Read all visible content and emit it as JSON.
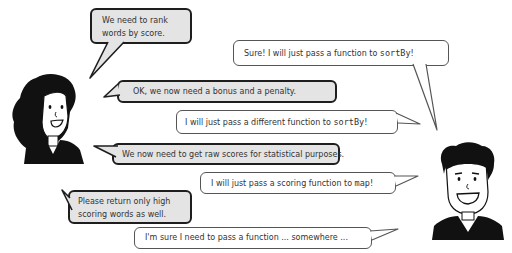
{
  "characters": {
    "left": {
      "role": "requester",
      "hair": "long-curly-black"
    },
    "right": {
      "role": "developer",
      "hair": "short-black"
    }
  },
  "dialogue": [
    {
      "speaker": "left",
      "style": "gray",
      "lines": [
        "We need to rank",
        "words by score."
      ]
    },
    {
      "speaker": "right",
      "style": "white",
      "text_before": "Sure! I will just pass a function to ",
      "code": "sortBy",
      "text_after": "!"
    },
    {
      "speaker": "left",
      "style": "gray",
      "text": "OK, we now need a bonus and a penalty."
    },
    {
      "speaker": "right",
      "style": "white",
      "text_before": "I will just pass a different function to ",
      "code": "sortBy",
      "text_after": "!"
    },
    {
      "speaker": "left",
      "style": "gray",
      "text": "We now need to get raw scores for statistical purposes."
    },
    {
      "speaker": "right",
      "style": "white",
      "text_before": "I will just pass a scoring function to ",
      "code": "map",
      "text_after": "!"
    },
    {
      "speaker": "left",
      "style": "gray",
      "lines": [
        "Please return only high",
        "scoring words as well."
      ]
    },
    {
      "speaker": "right",
      "style": "white",
      "text": "I'm sure I need to pass a function ... somewhere ..."
    }
  ],
  "colors": {
    "gray_bubble": "#e4e4e4",
    "white_bubble": "#ffffff",
    "outline": "#1e1e1e",
    "text": "#333333"
  }
}
